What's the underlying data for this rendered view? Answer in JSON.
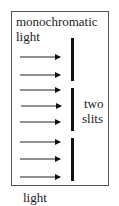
{
  "diagram": {
    "source_label_line1": "monochromatic",
    "source_label_line2": "light",
    "slits_label_line1": "two",
    "slits_label_line2": "slits",
    "caption": "light",
    "arrow_count": 8,
    "arrow_y": [
      57,
      75,
      90,
      106,
      122,
      142,
      159,
      177
    ],
    "barrier_segments": [
      [
        38,
        81
      ],
      [
        88,
        131
      ],
      [
        138,
        181
      ]
    ],
    "colors": {
      "line": "#111111",
      "border": "#555555",
      "text": "#222222"
    }
  }
}
